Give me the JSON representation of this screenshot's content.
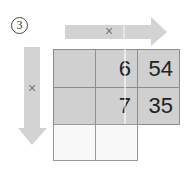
{
  "step": {
    "number": "3"
  },
  "top_arrow": {
    "symbol": "×",
    "direction": "right",
    "color": "#d3d3d3"
  },
  "left_arrow": {
    "symbol": "×",
    "direction": "down",
    "color": "#d3d3d3"
  },
  "grid": {
    "columns": 3,
    "rows": [
      {
        "cells": [
          "",
          "6",
          "54"
        ],
        "shaded": true
      },
      {
        "cells": [
          "",
          "7",
          "35"
        ],
        "shaded": true
      },
      {
        "cells": [
          "",
          ""
        ],
        "shaded": false
      }
    ],
    "shade_color": "#d0d0d0",
    "line_color": "#8d8d8d"
  }
}
